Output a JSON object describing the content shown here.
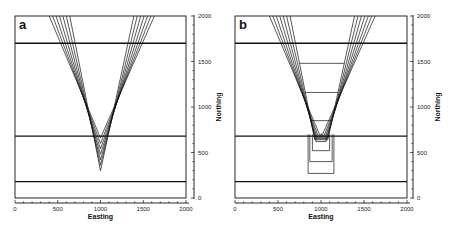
{
  "figure": {
    "panels": [
      {
        "id": "a",
        "letter": "a"
      },
      {
        "id": "b",
        "letter": "b"
      }
    ]
  },
  "chart_data": [
    {
      "type": "line",
      "panel": "a",
      "title": "",
      "xlabel": "Easting",
      "ylabel": "Northing",
      "xlim": [
        0,
        2000
      ],
      "ylim": [
        0,
        2000
      ],
      "x_ticks": [
        "0",
        "500",
        "1000",
        "1500",
        "2000"
      ],
      "y_ticks": [
        "0",
        "500",
        "1000",
        "1500",
        "2000"
      ],
      "grid": false,
      "horizontal_lines_northing": [
        1700,
        680,
        180
      ],
      "v_contours": {
        "count": 7,
        "apex_easting": 1000,
        "apex_northing_innermost": 300,
        "apex_spacing_northing": 60,
        "top_left_easting_outer": 400,
        "top_right_easting_outer": 1630,
        "spacing_easting_at_top": 40
      }
    },
    {
      "type": "line",
      "panel": "b",
      "title": "",
      "xlabel": "Easting",
      "ylabel": "Northing",
      "xlim": [
        0,
        2000
      ],
      "ylim": [
        0,
        2000
      ],
      "x_ticks": [
        "0",
        "500",
        "1000",
        "1500",
        "2000"
      ],
      "y_ticks": [
        "0",
        "500",
        "1000",
        "1500",
        "2000"
      ],
      "grid": false,
      "horizontal_lines_northing": [
        1700,
        680,
        180
      ],
      "v_contours": {
        "count": 7,
        "top_left_easting_outer": 400,
        "top_right_easting_outer": 1630,
        "spacing_easting_at_top": 40
      },
      "flat_bottom_contours_northing": [
        1480,
        1160,
        850
      ],
      "inner_u_contours": [
        {
          "left": 940,
          "right": 1060,
          "bottom": 620
        },
        {
          "left": 900,
          "right": 1100,
          "bottom": 520
        },
        {
          "left": 870,
          "right": 1130,
          "bottom": 400
        },
        {
          "left": 850,
          "right": 1150,
          "bottom": 270
        }
      ]
    }
  ]
}
